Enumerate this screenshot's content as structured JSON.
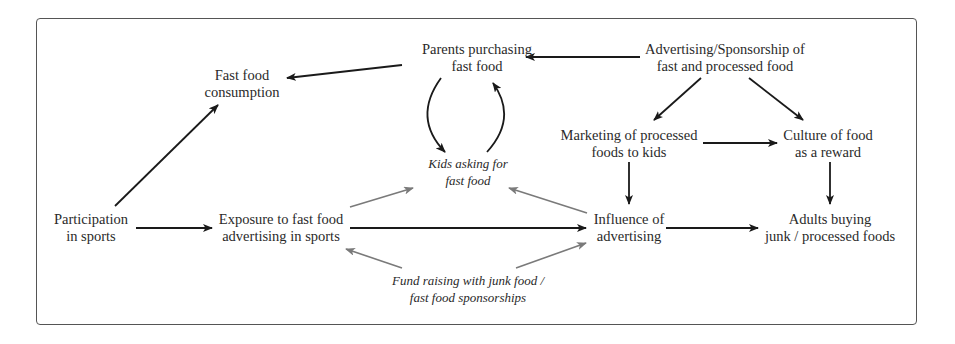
{
  "diagram": {
    "colors": {
      "frame": "#555555",
      "text": "#2a2a2a",
      "arrow_primary": "#1a1a1a",
      "arrow_secondary": "#7a7a7a"
    },
    "nodes": {
      "parents_purchasing": {
        "lines": [
          "Parents purchasing",
          "fast food"
        ],
        "style": "regular"
      },
      "advertising_sponsorship": {
        "lines": [
          "Advertising/Sponsorship of",
          "fast and processed food"
        ],
        "style": "regular"
      },
      "fast_food_consumption": {
        "lines": [
          "Fast food",
          "consumption"
        ],
        "style": "regular"
      },
      "marketing_to_kids": {
        "lines": [
          "Marketing of processed",
          "foods to kids"
        ],
        "style": "regular"
      },
      "culture_food_reward": {
        "lines": [
          "Culture of food",
          "as a reward"
        ],
        "style": "regular"
      },
      "kids_asking": {
        "lines": [
          "Kids asking for",
          "fast food"
        ],
        "style": "italic"
      },
      "participation_sports": {
        "lines": [
          "Participation",
          "in sports"
        ],
        "style": "regular"
      },
      "exposure_advertising": {
        "lines": [
          "Exposure to fast food",
          "advertising in sports"
        ],
        "style": "regular"
      },
      "influence_advertising": {
        "lines": [
          "Influence of",
          "advertising"
        ],
        "style": "regular"
      },
      "adults_buying": {
        "lines": [
          "Adults buying",
          "junk / processed foods"
        ],
        "style": "regular"
      },
      "fund_raising": {
        "lines": [
          "Fund raising with junk food /",
          "fast food sponsorships"
        ],
        "style": "italic"
      }
    },
    "edges": [
      {
        "from": "parents_purchasing",
        "to": "fast_food_consumption",
        "type": "primary"
      },
      {
        "from": "advertising_sponsorship",
        "to": "parents_purchasing",
        "type": "primary"
      },
      {
        "from": "advertising_sponsorship",
        "to": "marketing_to_kids",
        "type": "primary"
      },
      {
        "from": "advertising_sponsorship",
        "to": "culture_food_reward",
        "type": "primary"
      },
      {
        "from": "marketing_to_kids",
        "to": "culture_food_reward",
        "type": "primary"
      },
      {
        "from": "marketing_to_kids",
        "to": "influence_advertising",
        "type": "primary"
      },
      {
        "from": "culture_food_reward",
        "to": "adults_buying",
        "type": "primary"
      },
      {
        "from": "participation_sports",
        "to": "fast_food_consumption",
        "type": "primary"
      },
      {
        "from": "participation_sports",
        "to": "exposure_advertising",
        "type": "primary"
      },
      {
        "from": "exposure_advertising",
        "to": "influence_advertising",
        "type": "primary"
      },
      {
        "from": "influence_advertising",
        "to": "adults_buying",
        "type": "primary"
      },
      {
        "from": "parents_purchasing",
        "to": "kids_asking",
        "type": "primary-curved"
      },
      {
        "from": "kids_asking",
        "to": "parents_purchasing",
        "type": "primary-curved"
      },
      {
        "from": "exposure_advertising",
        "to": "kids_asking",
        "type": "secondary"
      },
      {
        "from": "influence_advertising",
        "to": "kids_asking",
        "type": "secondary"
      },
      {
        "from": "fund_raising",
        "to": "exposure_advertising",
        "type": "secondary"
      },
      {
        "from": "fund_raising",
        "to": "influence_advertising",
        "type": "secondary"
      }
    ]
  }
}
